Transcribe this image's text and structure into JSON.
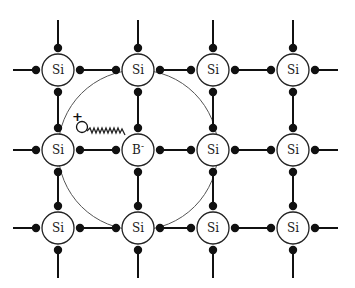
{
  "diagram": {
    "atoms": [
      {
        "label": "Si",
        "row": 0,
        "col": 0
      },
      {
        "label": "Si",
        "row": 0,
        "col": 1
      },
      {
        "label": "Si",
        "row": 0,
        "col": 2
      },
      {
        "label": "Si",
        "row": 0,
        "col": 3
      },
      {
        "label": "Si",
        "row": 1,
        "col": 0
      },
      {
        "label": "B",
        "sup": "-",
        "row": 1,
        "col": 1
      },
      {
        "label": "Si",
        "row": 1,
        "col": 2
      },
      {
        "label": "Si",
        "row": 1,
        "col": 3
      },
      {
        "label": "Si",
        "row": 2,
        "col": 0
      },
      {
        "label": "Si",
        "row": 2,
        "col": 1
      },
      {
        "label": "Si",
        "row": 2,
        "col": 2
      },
      {
        "label": "Si",
        "row": 2,
        "col": 3
      }
    ],
    "hole": {
      "label": "+"
    },
    "orbit": {
      "center": "B-",
      "description": "large circle showing the hole's orbit around the boron ion"
    },
    "colors": {
      "line": "#111111",
      "orbit": "#444444",
      "background": "#ffffff"
    }
  }
}
